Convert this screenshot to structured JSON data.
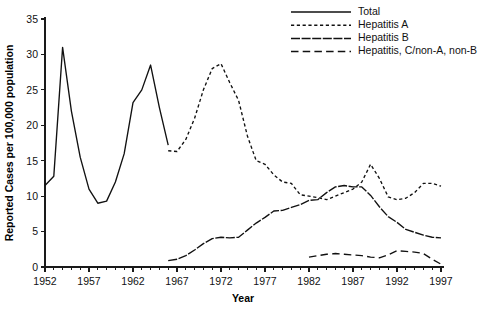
{
  "chart_data": {
    "type": "line",
    "title": "",
    "xlabel": "Year",
    "ylabel": "Reported Cases per 100,000 population",
    "xlim": [
      1952,
      1997
    ],
    "ylim": [
      0,
      35
    ],
    "ytick_step": 5,
    "xtick_step": 5,
    "x_minor_step": 1,
    "grid": false,
    "legend_position": "top-right",
    "yticks": [
      "0",
      "5",
      "10",
      "15",
      "20",
      "25",
      "30",
      "35"
    ],
    "xticks": [
      "1952",
      "1957",
      "1962",
      "1967",
      "1972",
      "1977",
      "1982",
      "1987",
      "1992",
      "1997"
    ],
    "series": [
      {
        "name": "Total",
        "style": "solid",
        "x": [
          1952,
          1953,
          1954,
          1955,
          1956,
          1957,
          1958,
          1959,
          1960,
          1961,
          1962,
          1963,
          1964,
          1965,
          1966
        ],
        "values": [
          11.5,
          12.8,
          31.0,
          22.0,
          15.5,
          11.0,
          9.0,
          9.3,
          12.0,
          16.0,
          23.2,
          25.0,
          28.5,
          22.5,
          17.2
        ]
      },
      {
        "name": "Hepatitis A",
        "style": "short-dash",
        "x": [
          1966,
          1967,
          1968,
          1969,
          1970,
          1971,
          1972,
          1973,
          1974,
          1975,
          1976,
          1977,
          1978,
          1979,
          1980,
          1981,
          1982,
          1983,
          1984,
          1985,
          1986,
          1987,
          1988,
          1989,
          1990,
          1991,
          1992,
          1993,
          1994,
          1995,
          1996,
          1997
        ],
        "values": [
          16.4,
          16.3,
          18.0,
          21.0,
          25.0,
          28.0,
          28.7,
          26.0,
          23.5,
          18.5,
          15.0,
          14.5,
          13.0,
          12.0,
          11.8,
          10.2,
          10.0,
          9.8,
          9.5,
          10.0,
          10.5,
          11.0,
          12.0,
          14.5,
          12.5,
          9.9,
          9.5,
          9.7,
          10.5,
          11.8,
          11.8,
          11.4
        ]
      },
      {
        "name": "Hepatitis B",
        "style": "long-dash",
        "x": [
          1966,
          1967,
          1968,
          1969,
          1970,
          1971,
          1972,
          1973,
          1974,
          1975,
          1976,
          1977,
          1978,
          1979,
          1980,
          1981,
          1982,
          1983,
          1984,
          1985,
          1986,
          1987,
          1988,
          1989,
          1990,
          1991,
          1992,
          1993,
          1994,
          1995,
          1996,
          1997
        ],
        "values": [
          0.9,
          1.1,
          1.6,
          2.4,
          3.3,
          4.0,
          4.2,
          4.1,
          4.2,
          5.2,
          6.2,
          7.0,
          7.9,
          8.0,
          8.4,
          8.8,
          9.4,
          9.5,
          10.5,
          11.3,
          11.5,
          11.3,
          11.3,
          10.1,
          8.5,
          7.1,
          6.3,
          5.3,
          4.9,
          4.5,
          4.2,
          4.1
        ]
      },
      {
        "name": "Hepatitis, C/non-A, non-B",
        "style": "dash-gap",
        "x": [
          1982,
          1983,
          1984,
          1985,
          1986,
          1987,
          1988,
          1989,
          1990,
          1991,
          1992,
          1993,
          1994,
          1995,
          1996,
          1997
        ],
        "values": [
          1.4,
          1.6,
          1.8,
          1.9,
          1.8,
          1.7,
          1.6,
          1.4,
          1.3,
          1.7,
          2.3,
          2.2,
          2.1,
          1.9,
          1.1,
          0.4
        ]
      }
    ],
    "legend": [
      {
        "label": "Total",
        "style": "solid"
      },
      {
        "label": "Hepatitis A",
        "style": "short-dash"
      },
      {
        "label": "Hepatitis B",
        "style": "long-dash"
      },
      {
        "label": "Hepatitis, C/non-A, non-B",
        "style": "dash-gap"
      }
    ]
  }
}
